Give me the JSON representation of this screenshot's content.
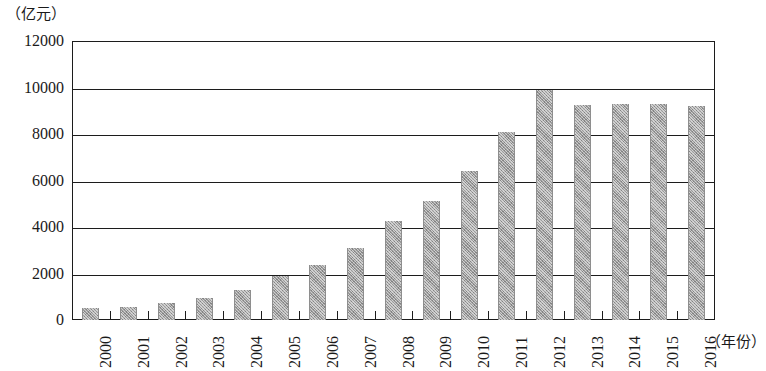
{
  "chart_data": {
    "type": "bar",
    "title": "",
    "subtitle": "",
    "xlabel": "（年份）",
    "ylabel": "（亿元）",
    "ylim": [
      0,
      12000
    ],
    "yticks": [
      0,
      2000,
      4000,
      6000,
      8000,
      10000,
      12000
    ],
    "ytick_labels": [
      "0",
      "2000",
      "4000",
      "6000",
      "8000",
      "10000",
      "12000"
    ],
    "grid": "horizontal",
    "legend": "none",
    "bar_color": "#9b9b9b",
    "axis_color": "#1c1c1c",
    "categories": [
      "2000",
      "2001",
      "2002",
      "2003",
      "2004",
      "2005",
      "2006",
      "2007",
      "2008",
      "2009",
      "2010",
      "2011",
      "2012",
      "2013",
      "2014",
      "2015",
      "2016"
    ],
    "values": [
      500,
      550,
      750,
      950,
      1300,
      1900,
      2350,
      3100,
      4250,
      5100,
      6400,
      8100,
      9900,
      9250,
      9300,
      9280,
      9200
    ]
  }
}
